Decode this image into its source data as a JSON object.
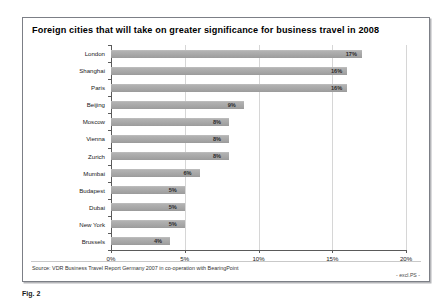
{
  "figure": {
    "title": "Foreign cities that will take on greater significance for business travel in 2008",
    "source_note": "Source: VDR Business Travel Report Germany 2007 in co-operation with BearingPoint",
    "excl_note": "- excl.PS -",
    "caption": "Fig. 2"
  },
  "colors": {
    "bar_fill": "#a9a9a9",
    "axis": "#5a5a5a",
    "gridline": "#d6d6d6",
    "frame_border": "#7c7f86"
  },
  "chart_data": {
    "type": "bar",
    "orientation": "horizontal",
    "title": "Foreign cities that will take on greater significance for business travel in 2008",
    "xlabel": "",
    "ylabel": "",
    "xlim": [
      0,
      20
    ],
    "xticks": [
      0,
      5,
      10,
      15,
      20
    ],
    "xtick_labels": [
      "0%",
      "5%",
      "10%",
      "15%",
      "20%"
    ],
    "grid": true,
    "legend": false,
    "value_suffix": "%",
    "categories": [
      "London",
      "Shanghai",
      "Paris",
      "Beijing",
      "Moscow",
      "Vienna",
      "Zurich",
      "Mumbai",
      "Budapest",
      "Dubai",
      "New York",
      "Brussels"
    ],
    "values": [
      17,
      16,
      16,
      9,
      8,
      8,
      8,
      6,
      5,
      5,
      5,
      4
    ],
    "data_labels": [
      "17%",
      "16%",
      "16%",
      "9%",
      "8%",
      "8%",
      "8%",
      "6%",
      "5%",
      "5%",
      "5%",
      "4%"
    ]
  }
}
